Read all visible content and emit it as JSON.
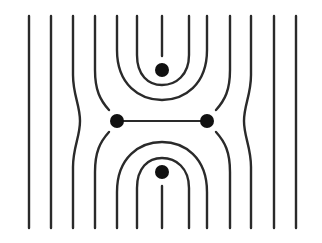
{
  "diagram": {
    "title": "",
    "colors": {
      "line": "#2a2a2a",
      "dot": "#111111",
      "background": "#ffffff"
    },
    "nodes": [
      {
        "id": "top",
        "x": 162,
        "y": 70,
        "r": 7
      },
      {
        "id": "bottom",
        "x": 162,
        "y": 172,
        "r": 7
      },
      {
        "id": "left",
        "x": 117,
        "y": 121,
        "r": 7
      },
      {
        "id": "right",
        "x": 207,
        "y": 121,
        "r": 7
      }
    ],
    "edges": [
      {
        "from": "left",
        "to": "right",
        "type": "bond"
      }
    ],
    "field_lines": {
      "straight_x": [
        29,
        51,
        274,
        296
      ],
      "bulging_x": [
        73,
        251
      ],
      "terminating_at_side_nodes_x": [
        95,
        230
      ],
      "outer_loops_x": [
        [
          117,
          207
        ]
      ],
      "inner_loops_x": [
        [
          137,
          189
        ]
      ],
      "center_stub_x": 162
    }
  }
}
